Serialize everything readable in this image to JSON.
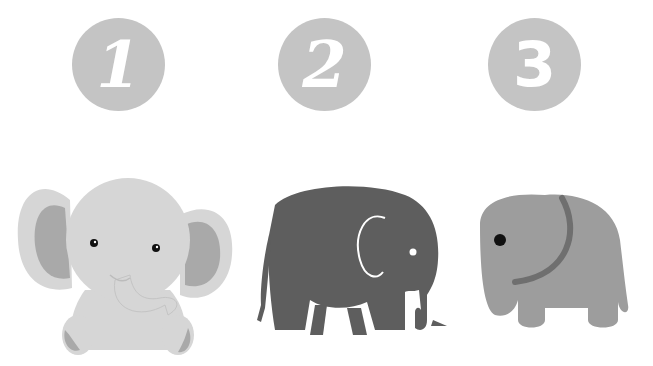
{
  "badges": [
    {
      "label": "1",
      "style": "script"
    },
    {
      "label": "2",
      "style": "script"
    },
    {
      "label": "3",
      "style": "plain"
    }
  ],
  "colors": {
    "badge_bg": "#c4c4c4",
    "badge_text": "#ffffff",
    "baby_body": "#d6d6d6",
    "baby_inner_ear": "#a9a9a9",
    "silhouette_body": "#5e5e5e",
    "cartoon_body": "#9d9d9d",
    "cartoon_ear_line": "#6f6f6f"
  },
  "elephants": [
    {
      "id": 1,
      "description": "baby-elephant-sitting"
    },
    {
      "id": 2,
      "description": "dark-silhouette-elephant"
    },
    {
      "id": 3,
      "description": "simple-cartoon-elephant"
    }
  ]
}
